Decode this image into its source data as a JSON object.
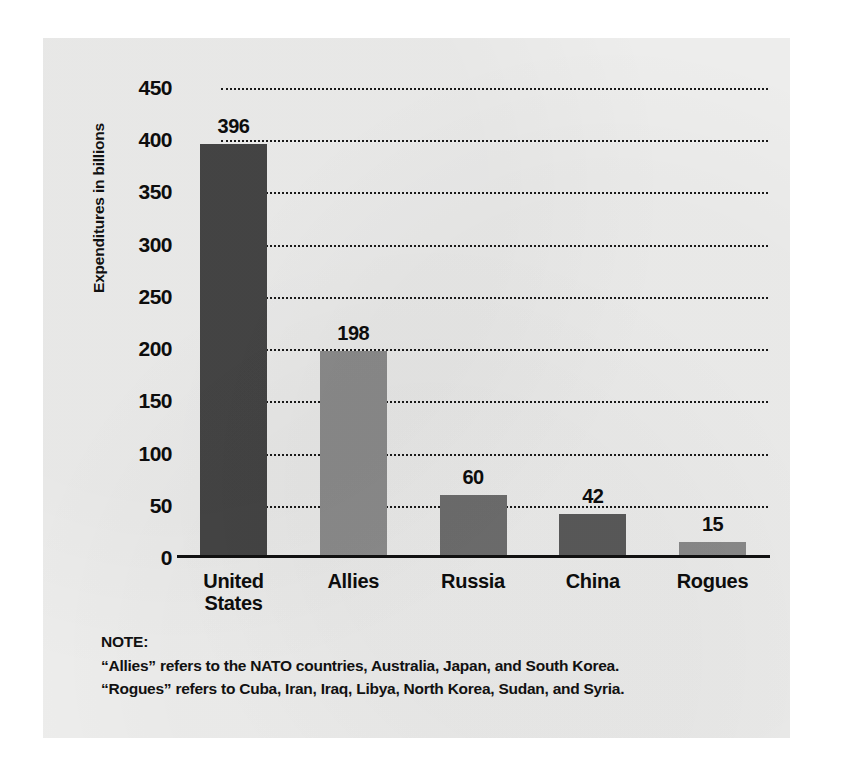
{
  "chart_data": {
    "type": "bar",
    "title": "",
    "xlabel": "",
    "ylabel": "Expenditures in billions",
    "ylim": [
      0,
      450
    ],
    "grid": true,
    "legend": "none",
    "categories": [
      "United States",
      "Allies",
      "Russia",
      "China",
      "Rogues"
    ],
    "values": [
      396,
      198,
      60,
      42,
      15
    ],
    "value_labels": [
      "396",
      "198",
      "60",
      "42",
      "15"
    ],
    "bar_colors": [
      "#454545",
      "#8d8d8d",
      "#6e6e6e",
      "#5a5a5a",
      "#8a8a8a"
    ],
    "y_ticks": [
      450,
      400,
      350,
      300,
      250,
      200,
      150,
      100,
      50,
      0
    ],
    "y_tick_labels": [
      "450",
      "400",
      "350",
      "300",
      "250",
      "200",
      "150",
      "100",
      "50",
      "0"
    ]
  },
  "axis": {
    "y_title": "Expenditures in billions"
  },
  "note": {
    "heading": "NOTE:",
    "lines": [
      "“Allies” refers to the NATO countries, Australia, Japan, and South Korea.",
      "“Rogues” refers to Cuba, Iran, Iraq, Libya, North Korea, Sudan, and Syria."
    ]
  },
  "colors": {
    "page_background": "#ffffff",
    "card_background": "#ededec",
    "ink": "#0d0d0d"
  }
}
